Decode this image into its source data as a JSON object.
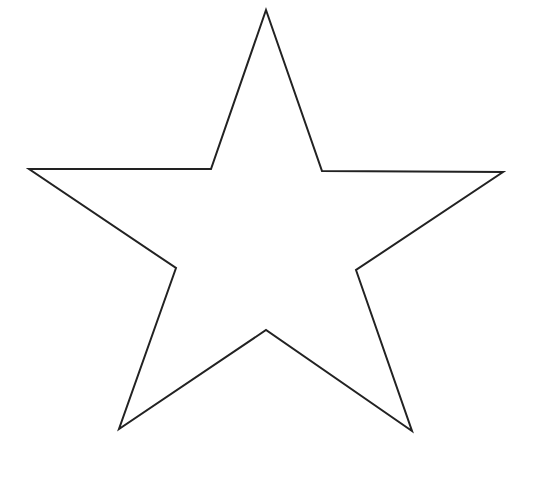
{
  "canvas": {
    "width": 536,
    "height": 483,
    "background": "#ffffff"
  },
  "shape": {
    "type": "star",
    "points_count": 5,
    "fill": "none",
    "stroke": "#222222",
    "stroke_width": 2,
    "vertices": [
      [
        266,
        10
      ],
      [
        322,
        171
      ],
      [
        503,
        172
      ],
      [
        356,
        270
      ],
      [
        412,
        431
      ],
      [
        266,
        330
      ],
      [
        119,
        429
      ],
      [
        176,
        268
      ],
      [
        29,
        169
      ],
      [
        211,
        169
      ]
    ]
  }
}
